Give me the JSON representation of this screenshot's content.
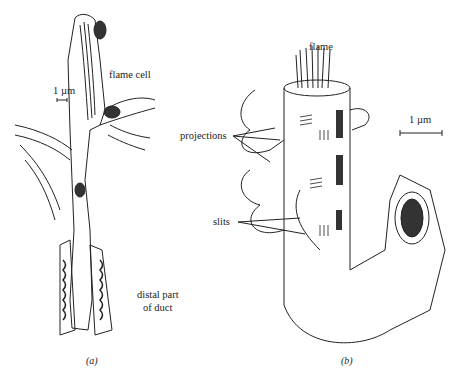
{
  "figure": {
    "panel_a": {
      "caption": "(a)",
      "labels": {
        "flame_cell": "flame cell",
        "scale": "1 µm",
        "distal_line1": "distal part",
        "distal_line2": "of duct"
      }
    },
    "panel_b": {
      "caption": "(b)",
      "labels": {
        "flame": "flame",
        "projections": "projections",
        "slits": "slits",
        "scale": "1 µm"
      }
    }
  }
}
